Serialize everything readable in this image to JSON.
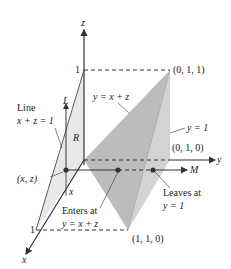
{
  "axes": {
    "x_label": "x",
    "y_label": "y",
    "z_label": "z",
    "x_tick": "1",
    "z_tick": "1"
  },
  "points": {
    "p011": "(0, 1, 1)",
    "p010": "(0, 1, 0)",
    "p110": "(1, 1, 0)",
    "xz": "(x, z)"
  },
  "labels": {
    "line_title": "Line",
    "line_eq": "x + z = 1",
    "plane_yxz": "y = x + z",
    "plane_y1": "y = 1",
    "L": "L",
    "R": "R",
    "x_small": "x",
    "M": "M",
    "enters_1": "Enters at",
    "enters_2": "y = x + z",
    "leaves_1": "Leaves at",
    "leaves_2": "y = 1"
  },
  "colors": {
    "plane_dark": "#b9b9b9",
    "plane_light": "#d6d6d6",
    "plane_left": "#e6e6e6",
    "axis": "#333333"
  }
}
